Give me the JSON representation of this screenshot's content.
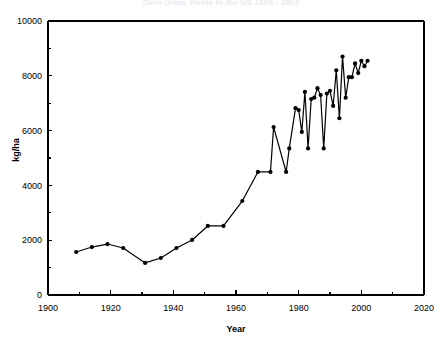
{
  "chart_data": {
    "type": "line",
    "title": "Corn Grain Yields in the US 1909 - 2002",
    "xlabel": "Year",
    "ylabel": "kg/ha",
    "xlim": [
      1900,
      2020
    ],
    "ylim": [
      0,
      10000
    ],
    "xticks": [
      1900,
      1920,
      1940,
      1960,
      1980,
      2000,
      2020
    ],
    "xtick_labels": [
      "1900",
      "1920",
      "1940",
      "1960",
      "1980",
      "2000",
      "2020"
    ],
    "xminor_step": 10,
    "yticks": [
      0,
      2000,
      4000,
      6000,
      8000,
      10000
    ],
    "ytick_labels": [
      "0",
      "2000",
      "4000",
      "6000",
      "8000",
      "10000"
    ],
    "yminor_step": 1000,
    "grid": false,
    "legend": "none",
    "marker": "filled-circle",
    "series": [
      {
        "name": "Corn grain yield",
        "x": [
          1909,
          1914,
          1919,
          1924,
          1931,
          1936,
          1941,
          1946,
          1951,
          1956,
          1962,
          1967,
          1971,
          1972,
          1976,
          1977,
          1979,
          1980,
          1981,
          1982,
          1983,
          1984,
          1985,
          1986,
          1987,
          1988,
          1989,
          1990,
          1991,
          1992,
          1993,
          1994,
          1995,
          1996,
          1997,
          1998,
          1999,
          2000,
          2001,
          2002
        ],
        "values": [
          1570,
          1750,
          1860,
          1715,
          1170,
          1350,
          1715,
          2010,
          2520,
          2520,
          3430,
          4490,
          4490,
          6130,
          4490,
          5350,
          6820,
          6750,
          5950,
          7410,
          5350,
          7150,
          7200,
          7550,
          7300,
          5350,
          7350,
          7450,
          6900,
          8200,
          6450,
          8700,
          7200,
          7950,
          7950,
          8450,
          8100,
          8550,
          8350,
          8550
        ]
      }
    ]
  },
  "axes": {
    "y_axis_label": "kg/ha",
    "x_axis_label": "Year"
  }
}
